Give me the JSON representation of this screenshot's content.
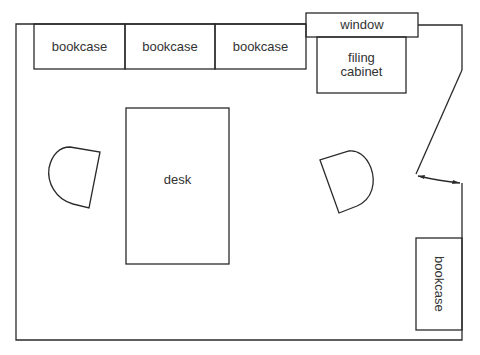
{
  "diagram": {
    "type": "office floor plan",
    "labels": {
      "bookcase_1": "bookcase",
      "bookcase_2": "bookcase",
      "bookcase_3": "bookcase",
      "window": "window",
      "filing_cabinet": "filing\ncabinet",
      "desk": "desk",
      "bookcase_right": "bookcase"
    },
    "colors": {
      "line": "#2a2a2a",
      "background": "#ffffff"
    }
  }
}
